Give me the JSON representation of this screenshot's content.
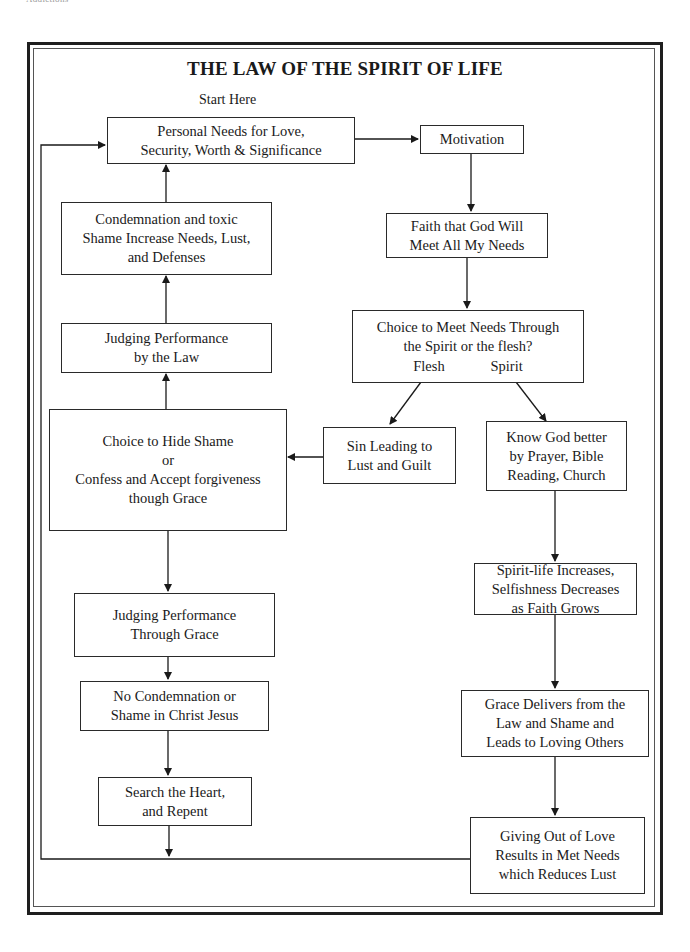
{
  "page": {
    "running_head": "Addictions",
    "title": "THE LAW OF THE SPIRIT OF LIFE",
    "start_label": "Start Here"
  },
  "nodes": {
    "personal_needs": [
      "Personal Needs for Love,",
      "Security, Worth & Significance"
    ],
    "motivation": [
      "Motivation"
    ],
    "faith": [
      "Faith that God Will",
      "Meet All My Needs"
    ],
    "choice_spirit_flesh": [
      "Choice to Meet Needs Through",
      "the Spirit or the flesh?"
    ],
    "branch_flesh": "Flesh",
    "branch_spirit": "Spirit",
    "sin": [
      "Sin Leading to",
      "Lust and Guilt"
    ],
    "know_god": [
      "Know God better",
      "by Prayer, Bible",
      "Reading, Church"
    ],
    "choice_hide": [
      "Choice to Hide Shame",
      "or",
      "Confess and Accept forgiveness",
      "though Grace"
    ],
    "judging_law": [
      "Judging Performance",
      "by the Law"
    ],
    "condemnation": [
      "Condemnation and toxic",
      "Shame Increase Needs, Lust,",
      "and Defenses"
    ],
    "judging_grace": [
      "Judging Performance",
      "Through Grace"
    ],
    "no_condemnation": [
      "No Condemnation or",
      "Shame in Christ Jesus"
    ],
    "search_heart": [
      "Search the Heart,",
      "and Repent"
    ],
    "spirit_life": [
      "Spirit-life Increases,",
      "Selfishness Decreases",
      "as Faith Grows"
    ],
    "grace_delivers": [
      "Grace Delivers from the",
      "Law and Shame and",
      "Leads to Loving Others"
    ],
    "giving": [
      "Giving Out of Love",
      "Results in Met Needs",
      "which Reduces Lust"
    ]
  },
  "edges": [
    {
      "from": "personal_needs",
      "to": "motivation"
    },
    {
      "from": "motivation",
      "to": "faith"
    },
    {
      "from": "faith",
      "to": "choice_spirit_flesh"
    },
    {
      "from": "choice_spirit_flesh",
      "to": "sin",
      "label": "Flesh"
    },
    {
      "from": "choice_spirit_flesh",
      "to": "know_god",
      "label": "Spirit"
    },
    {
      "from": "sin",
      "to": "choice_hide"
    },
    {
      "from": "choice_hide",
      "to": "judging_law"
    },
    {
      "from": "judging_law",
      "to": "condemnation"
    },
    {
      "from": "condemnation",
      "to": "personal_needs"
    },
    {
      "from": "choice_hide",
      "to": "judging_grace"
    },
    {
      "from": "judging_grace",
      "to": "no_condemnation"
    },
    {
      "from": "no_condemnation",
      "to": "search_heart"
    },
    {
      "from": "search_heart",
      "to": "loop_line"
    },
    {
      "from": "know_god",
      "to": "spirit_life"
    },
    {
      "from": "spirit_life",
      "to": "grace_delivers"
    },
    {
      "from": "grace_delivers",
      "to": "giving"
    },
    {
      "from": "giving",
      "to": "personal_needs",
      "via": "bottom-left loop"
    }
  ],
  "colors": {
    "ink": "#1a1a1a",
    "background": "#ffffff",
    "frame": "#1e1e1e"
  }
}
